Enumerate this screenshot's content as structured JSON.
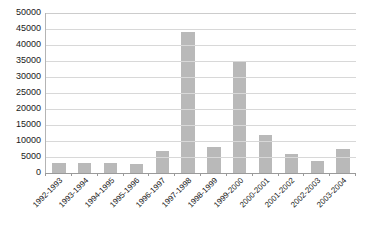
{
  "chart_data": {
    "type": "bar",
    "title": "",
    "subtitle": "",
    "xlabel": "",
    "ylabel": "",
    "ylim": [
      0,
      50000
    ],
    "grid": true,
    "legend": false,
    "legend_position": "none",
    "bar_color": "#b9b9b9",
    "categories": [
      "1992-1993",
      "1993-1994",
      "1994-1995",
      "1995-1996",
      "1996-1997",
      "1997-1998",
      "1998-1999",
      "1999-2000",
      "2000-2001",
      "2001-2002",
      "2002-2003",
      "2003-2004"
    ],
    "values": [
      3000,
      3200,
      3000,
      2800,
      6800,
      44000,
      8000,
      35000,
      12000,
      6000,
      3800,
      7500
    ],
    "yticks": [
      0,
      5000,
      10000,
      15000,
      20000,
      25000,
      30000,
      35000,
      40000,
      45000,
      50000
    ],
    "ytick_labels": [
      "0",
      "5000",
      "10000",
      "15000",
      "20000",
      "25000",
      "30000",
      "35000",
      "40000",
      "45000",
      "50000"
    ]
  }
}
